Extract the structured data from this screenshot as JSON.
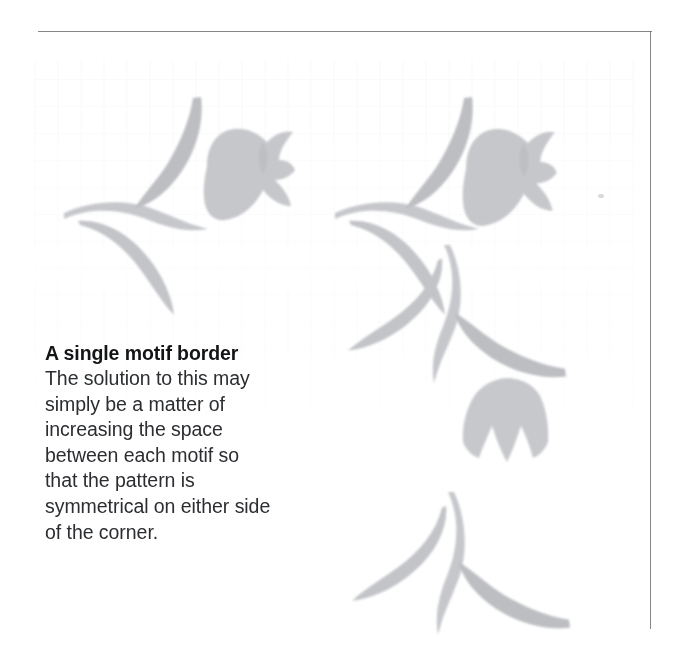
{
  "page": {
    "kind": "scanned-book-page",
    "background_color": "#ffffff",
    "rule_color": "#6f7176",
    "has_top_rule": true,
    "has_right_rule": true
  },
  "caption": {
    "heading": "A single motif border",
    "body": "The solution to this may\nsimply be a matter of\nincreasing the space\nbetween each motif so\nthat the pattern is\nsymmetrical on either side\nof the corner.",
    "body_lines": [
      "The solution to this may",
      "simply be a matter of",
      "increasing the space",
      "between each motif so",
      "that the pattern is",
      "symmetrical on either side",
      "of the corner."
    ],
    "heading_color": "#131517",
    "body_color": "#2b2d30"
  },
  "artwork": {
    "title": "stencilled floral border with corner",
    "ink_color": "#c9cacd",
    "ink_color_dark": "#b4b6ba",
    "ink_color_light": "#dcdde0",
    "description": "Pale grey stencil-printed leaf-and-tulip motifs forming a horizontal border along the top and a vertical border down the right, meeting at a corner.",
    "motifs": [
      {
        "id": "top-leaf-stem-1",
        "name": "leaf-and-stem-motif",
        "orientation": "horizontal",
        "x": 62,
        "y": 95,
        "width": 145,
        "height": 140
      },
      {
        "id": "top-flower-1",
        "name": "tulip-flower-motif",
        "orientation": "horizontal",
        "x": 203,
        "y": 126,
        "width": 90,
        "height": 100
      },
      {
        "id": "top-leaf-stem-2",
        "name": "leaf-and-stem-motif",
        "orientation": "horizontal",
        "x": 333,
        "y": 95,
        "width": 145,
        "height": 140
      },
      {
        "id": "corner-flower",
        "name": "tulip-flower-motif",
        "orientation": "horizontal",
        "x": 462,
        "y": 126,
        "width": 95,
        "height": 110
      },
      {
        "id": "right-leaf-stem-1",
        "name": "leaf-and-stem-motif",
        "orientation": "vertical",
        "x": 428,
        "y": 243,
        "width": 140,
        "height": 130
      },
      {
        "id": "right-bell-flower",
        "name": "bell-flower-motif",
        "orientation": "vertical",
        "x": 455,
        "y": 378,
        "width": 100,
        "height": 90
      },
      {
        "id": "right-leaf-stem-2",
        "name": "leaf-and-stem-motif",
        "orientation": "vertical",
        "x": 428,
        "y": 490,
        "width": 145,
        "height": 135
      }
    ]
  }
}
